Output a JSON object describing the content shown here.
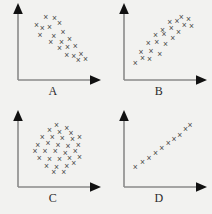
{
  "figure": {
    "title": "",
    "background_color": "#f2f2f0",
    "axis_color": "#8a8a8a",
    "marker_color": "#4a4a4a",
    "marker_glyph": "×",
    "panel_count": 4,
    "layout": "2x2 grid"
  },
  "chart_data": [
    {
      "type": "scatter",
      "id": "A",
      "title": "A",
      "xlabel": "A",
      "ylabel": "",
      "xlim": [
        0,
        100
      ],
      "ylim": [
        0,
        100
      ],
      "grid": false,
      "legend": "none",
      "relationship": "strong negative correlation",
      "marker": "x",
      "points": [
        [
          20,
          78
        ],
        [
          33,
          90
        ],
        [
          45,
          88
        ],
        [
          28,
          72
        ],
        [
          38,
          74
        ],
        [
          52,
          80
        ],
        [
          25,
          62
        ],
        [
          44,
          60
        ],
        [
          57,
          66
        ],
        [
          40,
          52
        ],
        [
          55,
          52
        ],
        [
          66,
          56
        ],
        [
          52,
          42
        ],
        [
          63,
          44
        ],
        [
          74,
          46
        ],
        [
          62,
          32
        ],
        [
          72,
          30
        ],
        [
          82,
          34
        ],
        [
          78,
          24
        ],
        [
          88,
          26
        ]
      ]
    },
    {
      "type": "scatter",
      "id": "B",
      "title": "B",
      "xlabel": "B",
      "ylabel": "",
      "xlim": [
        0,
        100
      ],
      "ylim": [
        0,
        100
      ],
      "grid": false,
      "legend": "none",
      "relationship": "moderate positive correlation",
      "marker": "x",
      "points": [
        [
          10,
          20
        ],
        [
          20,
          28
        ],
        [
          30,
          26
        ],
        [
          18,
          36
        ],
        [
          32,
          38
        ],
        [
          44,
          34
        ],
        [
          28,
          50
        ],
        [
          40,
          52
        ],
        [
          52,
          48
        ],
        [
          38,
          62
        ],
        [
          50,
          64
        ],
        [
          62,
          58
        ],
        [
          48,
          70
        ],
        [
          60,
          72
        ],
        [
          70,
          66
        ],
        [
          58,
          82
        ],
        [
          68,
          84
        ],
        [
          78,
          78
        ],
        [
          74,
          90
        ],
        [
          84,
          86
        ],
        [
          88,
          76
        ]
      ]
    },
    {
      "type": "scatter",
      "id": "C",
      "title": "C",
      "xlabel": "C",
      "ylabel": "",
      "xlim": [
        0,
        100
      ],
      "ylim": [
        0,
        100
      ],
      "grid": false,
      "legend": "none",
      "relationship": "no correlation (circular cloud)",
      "marker": "x",
      "points": [
        [
          48,
          88
        ],
        [
          62,
          84
        ],
        [
          38,
          80
        ],
        [
          52,
          78
        ],
        [
          68,
          76
        ],
        [
          28,
          70
        ],
        [
          42,
          70
        ],
        [
          56,
          68
        ],
        [
          70,
          66
        ],
        [
          80,
          70
        ],
        [
          22,
          58
        ],
        [
          36,
          60
        ],
        [
          50,
          58
        ],
        [
          64,
          56
        ],
        [
          78,
          58
        ],
        [
          18,
          48
        ],
        [
          32,
          48
        ],
        [
          46,
          48
        ],
        [
          60,
          46
        ],
        [
          74,
          48
        ],
        [
          24,
          38
        ],
        [
          38,
          36
        ],
        [
          52,
          36
        ],
        [
          66,
          38
        ],
        [
          80,
          40
        ],
        [
          34,
          26
        ],
        [
          48,
          24
        ],
        [
          62,
          26
        ],
        [
          72,
          30
        ],
        [
          44,
          16
        ],
        [
          58,
          16
        ]
      ]
    },
    {
      "type": "scatter",
      "id": "D",
      "title": "D",
      "xlabel": "D",
      "ylabel": "",
      "xlim": [
        0,
        100
      ],
      "ylim": [
        0,
        100
      ],
      "grid": false,
      "legend": "none",
      "relationship": "near-perfect positive linear relationship",
      "marker": "x",
      "points": [
        [
          10,
          24
        ],
        [
          20,
          32
        ],
        [
          29,
          38
        ],
        [
          38,
          46
        ],
        [
          47,
          53
        ],
        [
          56,
          60
        ],
        [
          64,
          66
        ],
        [
          72,
          73
        ],
        [
          80,
          82
        ],
        [
          86,
          88
        ]
      ]
    }
  ],
  "panels": {
    "A": {
      "label": "A"
    },
    "B": {
      "label": "B"
    },
    "C": {
      "label": "C"
    },
    "D": {
      "label": "D"
    }
  }
}
